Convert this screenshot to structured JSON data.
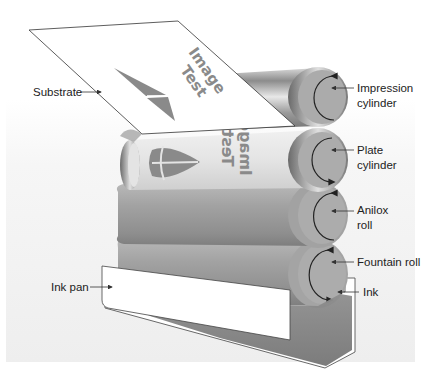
{
  "figure": {
    "colors": {
      "background_panel": "#f1f1f1",
      "cylinder_gray": "#9a9a9a",
      "plate_light": "#e2e2e2",
      "substrate": "#ffffff",
      "ink": "#8c8c8c",
      "label_text": "#222222",
      "leader_line": "#333333"
    }
  },
  "labels": {
    "substrate": "Substrate",
    "impression_line1": "Impression",
    "impression_line2": "cylinder",
    "plate_line1": "Plate",
    "plate_line2": "cylinder",
    "anilox_line1": "Anilox",
    "anilox_line2": "roll",
    "fountain": "Fountain roll",
    "ink_pan": "Ink pan",
    "ink": "Ink"
  },
  "artwork": {
    "substrate_text_line1": "Image",
    "substrate_text_line2": "Test",
    "plate_text_line1": "Image",
    "plate_text_line2": "Test"
  },
  "components": [
    {
      "name": "Substrate",
      "type": "sheet"
    },
    {
      "name": "Impression cylinder",
      "type": "cylinder",
      "rotation": "clockwise"
    },
    {
      "name": "Plate cylinder",
      "type": "cylinder",
      "rotation": "counter-clockwise"
    },
    {
      "name": "Anilox roll",
      "type": "cylinder",
      "rotation": "clockwise"
    },
    {
      "name": "Fountain roll",
      "type": "cylinder",
      "rotation": "counter-clockwise"
    },
    {
      "name": "Ink pan",
      "type": "tray"
    },
    {
      "name": "Ink",
      "type": "fluid"
    }
  ]
}
